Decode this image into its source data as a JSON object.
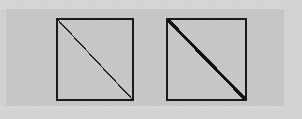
{
  "figure": {
    "background_color": "#c8c8c6",
    "margin_color": "#d6d6d4",
    "ink_color": "#1b1b1b",
    "canvas": {
      "width": 302,
      "height": 119
    },
    "panels": [
      {
        "id": "left-panel",
        "label": "left square with thin diagonal",
        "square": {
          "x": 57,
          "y": 19,
          "width": 76,
          "height": 81,
          "stroke_width": 2,
          "stroke_color": "#1b1b1b"
        },
        "diagonal": {
          "from": "top-left",
          "to": "bottom-right",
          "x1": 58,
          "y1": 20,
          "x2": 132,
          "y2": 99,
          "stroke_width": 1.25,
          "stroke_color": "#232323",
          "appearance": "thin aliased stair-stepped line"
        }
      },
      {
        "id": "right-panel",
        "label": "right square with thick diagonal",
        "square": {
          "x": 167,
          "y": 19,
          "width": 79,
          "height": 81,
          "stroke_width": 2,
          "stroke_color": "#1b1b1b"
        },
        "diagonal": {
          "from": "top-left",
          "to": "bottom-right",
          "x1": 168,
          "y1": 20,
          "x2": 245,
          "y2": 99,
          "stroke_width": 3.2,
          "stroke_color": "#111111",
          "appearance": "thick aliased stair-stepped line"
        }
      }
    ]
  }
}
